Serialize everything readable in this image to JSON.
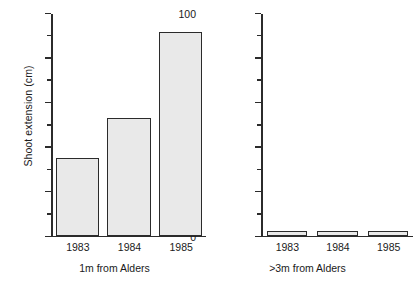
{
  "chart_data": {
    "type": "bar",
    "title": "",
    "subtitle": "",
    "ylabel": "Shoot extension (cm)",
    "xlabel": "",
    "ylim": [
      0,
      100
    ],
    "grid": false,
    "legend": "none",
    "yticks_major": [
      0,
      20,
      40,
      60,
      80,
      100
    ],
    "yticks_minor": [
      10,
      30,
      50,
      70,
      90
    ],
    "ytick_labels": [
      "0",
      "20",
      "40",
      "60",
      "80",
      "100"
    ],
    "categories": [
      "1983",
      "1984",
      "1985"
    ],
    "panels": [
      {
        "name": "1m from Alders",
        "xlabel": "1m from Alders",
        "categories": [
          "1983",
          "1984",
          "1985"
        ],
        "values": [
          35,
          53,
          92
        ],
        "show_ytick_labels": true
      },
      {
        "name": ">3m from Alders",
        "xlabel": ">3m from Alders",
        "categories": [
          "1983",
          "1984",
          "1985"
        ],
        "values": [
          2,
          2,
          2
        ],
        "show_ytick_labels": false
      }
    ],
    "colors": {
      "bar_fill": "#e9e9e9",
      "bar_edge": "#2b2b2b",
      "axis": "#2b2b2b",
      "text": "#1a1a1a",
      "background": "#ffffff"
    }
  }
}
